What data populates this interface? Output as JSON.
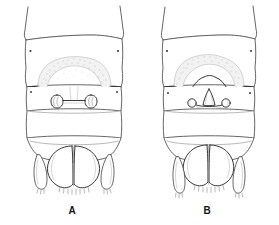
{
  "plate": {
    "title": "Comparative ventral views of two insect terminal abdomens",
    "background_color": "#ffffff",
    "line_color": "#4a4a4a",
    "label_color": "#161616",
    "width": 279,
    "height": 225
  },
  "figures": [
    {
      "id": "A",
      "label": "A",
      "label_x": 72,
      "label_y": 214,
      "center_x": 72,
      "description": "ventral view of terminal abdominal segments with transverse stippled band, paired dumbbell-shaped sclerites and broad apical lobes",
      "parts": [
        {
          "name": "anterior-segment",
          "label": ""
        },
        {
          "name": "stippled-band",
          "label": ""
        },
        {
          "name": "paired-sclerite-left",
          "label": ""
        },
        {
          "name": "paired-sclerite-right",
          "label": ""
        },
        {
          "name": "median-segment",
          "label": ""
        },
        {
          "name": "apical-lobe-left",
          "label": ""
        },
        {
          "name": "apical-lobe-right",
          "label": ""
        },
        {
          "name": "lateral-process-left",
          "label": ""
        },
        {
          "name": "lateral-process-right",
          "label": ""
        }
      ]
    },
    {
      "id": "B",
      "label": "B",
      "label_x": 207,
      "label_y": 214,
      "center_x": 207,
      "description": "ventral view of terminal abdominal segments with transverse stippled band, median triangular process flanked by small round sclerites and narrower apical lobes",
      "parts": [
        {
          "name": "anterior-segment",
          "label": ""
        },
        {
          "name": "stippled-band",
          "label": ""
        },
        {
          "name": "median-triangular-process",
          "label": ""
        },
        {
          "name": "round-sclerite-left",
          "label": ""
        },
        {
          "name": "round-sclerite-right",
          "label": ""
        },
        {
          "name": "median-segment",
          "label": ""
        },
        {
          "name": "apical-lobe-left",
          "label": ""
        },
        {
          "name": "apical-lobe-right",
          "label": ""
        },
        {
          "name": "lateral-process-left",
          "label": ""
        },
        {
          "name": "lateral-process-right",
          "label": ""
        }
      ]
    }
  ]
}
